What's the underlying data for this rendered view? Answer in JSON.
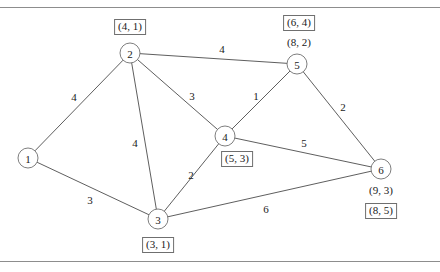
{
  "figure": {
    "type": "weighted-undirected-graph",
    "title": "",
    "rules": {
      "top_y": 7,
      "bottom_y": 261
    }
  },
  "nodes": [
    {
      "id": "1",
      "label": "1",
      "x": 28,
      "y": 158,
      "r": 10,
      "annotations": []
    },
    {
      "id": "2",
      "label": "2",
      "x": 130,
      "y": 53,
      "r": 10,
      "annotations": [
        {
          "text": "(4, 1)",
          "boxed": true,
          "x": 130,
          "y": 27
        }
      ]
    },
    {
      "id": "3",
      "label": "3",
      "x": 158,
      "y": 219,
      "r": 10,
      "annotations": [
        {
          "text": "(3, 1)",
          "boxed": true,
          "x": 158,
          "y": 245
        }
      ]
    },
    {
      "id": "4",
      "label": "4",
      "x": 225,
      "y": 136,
      "r": 10,
      "annotations": [
        {
          "text": "(5, 3)",
          "boxed": true,
          "x": 237,
          "y": 159
        }
      ]
    },
    {
      "id": "5",
      "label": "5",
      "x": 297,
      "y": 64,
      "r": 10,
      "annotations": [
        {
          "text": "(6, 4)",
          "boxed": true,
          "x": 299,
          "y": 23
        },
        {
          "text": "(8, 2)",
          "boxed": false,
          "x": 299,
          "y": 42
        }
      ]
    },
    {
      "id": "6",
      "label": "6",
      "x": 381,
      "y": 169,
      "r": 10,
      "annotations": [
        {
          "text": "(9, 3)",
          "boxed": false,
          "x": 381,
          "y": 190
        },
        {
          "text": "(8, 5)",
          "boxed": true,
          "x": 381,
          "y": 211
        }
      ]
    }
  ],
  "edges": [
    {
      "from": "1",
      "to": "2",
      "weight": "4",
      "lx": 74,
      "ly": 97
    },
    {
      "from": "1",
      "to": "3",
      "weight": "3",
      "lx": 90,
      "ly": 200
    },
    {
      "from": "2",
      "to": "3",
      "weight": "4",
      "lx": 135,
      "ly": 143
    },
    {
      "from": "2",
      "to": "4",
      "weight": "3",
      "lx": 192,
      "ly": 96
    },
    {
      "from": "2",
      "to": "5",
      "weight": "4",
      "lx": 222,
      "ly": 49
    },
    {
      "from": "3",
      "to": "4",
      "weight": "2",
      "lx": 191,
      "ly": 175
    },
    {
      "from": "3",
      "to": "6",
      "weight": "6",
      "lx": 266,
      "ly": 209
    },
    {
      "from": "4",
      "to": "5",
      "weight": "1",
      "lx": 256,
      "ly": 96
    },
    {
      "from": "4",
      "to": "6",
      "weight": "5",
      "lx": 304,
      "ly": 143
    },
    {
      "from": "5",
      "to": "6",
      "weight": "2",
      "lx": 343,
      "ly": 107
    }
  ],
  "colors": {
    "line": "#4c4c4c",
    "node_stroke": "#6f6f6f",
    "rule": "#8d8d8d",
    "text": "#1a1a1a",
    "background": "#ffffff"
  }
}
